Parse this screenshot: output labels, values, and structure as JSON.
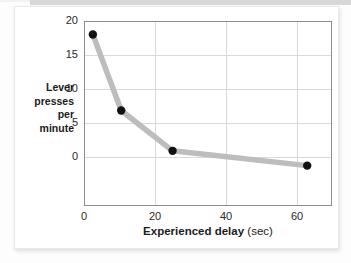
{
  "chart_data": {
    "type": "line",
    "title": "",
    "xlabel": "Experienced delay (sec)",
    "xlabel_main": "Experienced delay",
    "xlabel_unit": "(sec)",
    "ylabel": "Lever presses per minute",
    "ylabel_lines": [
      "Lever",
      "presses",
      "per",
      "minute"
    ],
    "x": [
      2.5,
      10.5,
      25.0,
      63.0
    ],
    "values": [
      19.5,
      8.2,
      2.2,
      0.0
    ],
    "series": [
      {
        "name": "Lever presses per minute",
        "x": [
          2.5,
          10.5,
          25.0,
          63.0
        ],
        "values": [
          19.5,
          8.2,
          2.2,
          0.0
        ]
      }
    ],
    "xlim": [
      0,
      70
    ],
    "ylim": [
      -6,
      21.5
    ],
    "xticks": [
      0,
      20,
      40,
      60
    ],
    "yticks": [
      0,
      5,
      10,
      15,
      20
    ],
    "xtick_labels": [
      "0",
      "20",
      "40",
      "60"
    ],
    "ytick_labels": [
      "0",
      "5",
      "10",
      "15",
      "20"
    ],
    "grid": true,
    "legend": null,
    "line_color": "#bdbdbd",
    "marker_color": "#111111",
    "grid_color": "#d9d9d9",
    "frame_color": "#8e8e8e"
  }
}
